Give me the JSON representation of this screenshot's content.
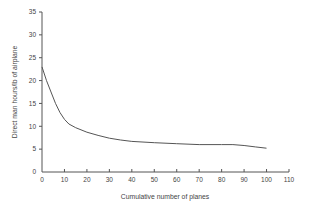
{
  "chart_data": {
    "type": "line",
    "title": "",
    "xlabel": "Cumulative number of planes",
    "ylabel": "Direct man hours/lb of airplane",
    "xlim": [
      0,
      110
    ],
    "ylim": [
      0,
      35
    ],
    "x_ticks": [
      0,
      10,
      20,
      30,
      40,
      50,
      60,
      70,
      80,
      90,
      100,
      110
    ],
    "y_ticks": [
      0,
      5,
      10,
      15,
      20,
      25,
      30,
      35
    ],
    "grid": false,
    "legend": null,
    "series": [
      {
        "name": "Learning curve",
        "x": [
          0,
          2,
          4,
          6,
          8,
          10,
          12,
          15,
          20,
          25,
          30,
          35,
          40,
          50,
          60,
          70,
          80,
          85,
          90,
          95,
          100
        ],
        "y": [
          23,
          20,
          17.5,
          15,
          13,
          11.5,
          10.5,
          9.7,
          8.7,
          8.0,
          7.4,
          7.0,
          6.7,
          6.4,
          6.2,
          6.0,
          6.0,
          6.0,
          5.8,
          5.5,
          5.2
        ]
      }
    ]
  }
}
